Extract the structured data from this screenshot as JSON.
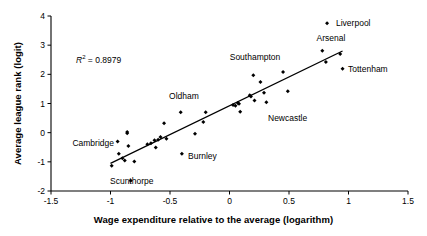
{
  "chart_data": {
    "type": "scatter",
    "title": "",
    "xlabel": "Wage expenditure relative to the average (logarithm)",
    "ylabel": "Average league rank (logit)",
    "xlim": [
      -1.5,
      1.5
    ],
    "ylim": [
      -2,
      4
    ],
    "xticks": [
      -1.5,
      -1,
      -0.5,
      0,
      0.5,
      1,
      1.5
    ],
    "xticklabels": [
      "-1.5",
      "-1",
      "-0.5",
      "0",
      "0.5",
      "1",
      "1.5"
    ],
    "yticks": [
      -2,
      -1,
      0,
      1,
      2,
      3,
      4
    ],
    "yticklabels": [
      "-2",
      "-1",
      "0",
      "1",
      "2",
      "3",
      "4"
    ],
    "grid": false,
    "legend": null,
    "marker": "diamond",
    "marker_color": "#000000",
    "annotations": [
      {
        "name": "r-squared",
        "text": "R2 = 0.8979",
        "r_symbol": "R",
        "superscript": "2",
        "equals_value": "= 0.8979",
        "x": -0.93,
        "y": 2.45
      }
    ],
    "trendline": {
      "type": "linear",
      "x_start": -1.0,
      "y_start": -1.05,
      "x_end": 0.95,
      "y_end": 2.8,
      "color": "#000000",
      "r_squared": 0.8979
    },
    "points": [
      {
        "x": -0.99,
        "y": -1.13,
        "label": ""
      },
      {
        "x": -0.94,
        "y": -0.3,
        "label": ""
      },
      {
        "x": -0.93,
        "y": -0.72,
        "label": ""
      },
      {
        "x": -0.9,
        "y": -0.88,
        "label": ""
      },
      {
        "x": -0.88,
        "y": -0.95,
        "label": ""
      },
      {
        "x": -0.86,
        "y": 0.02,
        "label": ""
      },
      {
        "x": -0.86,
        "y": -0.02,
        "label": ""
      },
      {
        "x": -0.85,
        "y": -0.46,
        "label": ""
      },
      {
        "x": -0.83,
        "y": -1.65,
        "label": "Scunthorpe",
        "label_pos": "right"
      },
      {
        "x": -0.8,
        "y": -0.99,
        "label": ""
      },
      {
        "x": -0.69,
        "y": -0.4,
        "label": ""
      },
      {
        "x": -0.66,
        "y": -0.36,
        "label": ""
      },
      {
        "x": -0.63,
        "y": -0.26,
        "label": ""
      },
      {
        "x": -0.62,
        "y": -0.51,
        "label": ""
      },
      {
        "x": -0.6,
        "y": -0.24,
        "label": ""
      },
      {
        "x": -0.58,
        "y": -0.15,
        "label": ""
      },
      {
        "x": -0.55,
        "y": 0.32,
        "label": ""
      },
      {
        "x": -0.53,
        "y": -0.21,
        "label": ""
      },
      {
        "x": -0.41,
        "y": 0.7,
        "label": "Oldham",
        "label_pos": "above"
      },
      {
        "x": -0.4,
        "y": -0.72,
        "label": "Burnley",
        "label_pos": "right"
      },
      {
        "x": -0.29,
        "y": -0.04,
        "label": ""
      },
      {
        "x": -0.22,
        "y": 0.37,
        "label": ""
      },
      {
        "x": -0.2,
        "y": 0.7,
        "label": ""
      },
      {
        "x": 0.03,
        "y": 0.95,
        "label": ""
      },
      {
        "x": 0.05,
        "y": 0.92,
        "label": ""
      },
      {
        "x": 0.07,
        "y": 1.02,
        "label": ""
      },
      {
        "x": 0.08,
        "y": 0.99,
        "label": ""
      },
      {
        "x": 0.09,
        "y": 0.72,
        "label": ""
      },
      {
        "x": 0.17,
        "y": 1.28,
        "label": ""
      },
      {
        "x": 0.18,
        "y": 1.24,
        "label": ""
      },
      {
        "x": 0.2,
        "y": 1.97,
        "label": "Southampton",
        "label_pos": "above"
      },
      {
        "x": 0.21,
        "y": 1.1,
        "label": ""
      },
      {
        "x": 0.26,
        "y": 1.74,
        "label": ""
      },
      {
        "x": 0.29,
        "y": 1.37,
        "label": ""
      },
      {
        "x": 0.31,
        "y": 1.04,
        "label": "Newcastle",
        "label_pos": "below-right"
      },
      {
        "x": 0.45,
        "y": 2.08,
        "label": ""
      },
      {
        "x": 0.49,
        "y": 1.42,
        "label": ""
      },
      {
        "x": 0.78,
        "y": 2.81,
        "label": "Arsenal",
        "label_pos": "above"
      },
      {
        "x": 0.81,
        "y": 2.42,
        "label": ""
      },
      {
        "x": 0.82,
        "y": 3.75,
        "label": "Liverpool",
        "label_pos": "right"
      },
      {
        "x": 0.93,
        "y": 2.7,
        "label": ""
      },
      {
        "x": 0.95,
        "y": 2.19,
        "label": "Tottenham",
        "label_pos": "right"
      }
    ]
  },
  "labels": {
    "liverpool": "Liverpool",
    "arsenal": "Arsenal",
    "tottenham": "Tottenham",
    "southampton": "Southampton",
    "newcastle": "Newcastle",
    "oldham": "Oldham",
    "cambridge": "Cambridge",
    "burnley": "Burnley",
    "scunthorpe": "Scunthorpe"
  },
  "callouts": [
    {
      "name": "liverpool",
      "text": "Liverpool",
      "x": 336,
      "y": 23,
      "align": "right"
    },
    {
      "name": "arsenal",
      "text": "Arsenal",
      "x": 331,
      "y": 43,
      "align": "above"
    },
    {
      "name": "tottenham",
      "text": "Tottenham",
      "x": 348,
      "y": 69,
      "align": "right"
    },
    {
      "name": "southampton",
      "text": "Southampton",
      "x": 255,
      "y": 62,
      "align": "above"
    },
    {
      "name": "newcastle",
      "text": "Newcastle",
      "x": 268,
      "y": 118,
      "align": "left-text"
    },
    {
      "name": "oldham",
      "text": "Oldham",
      "x": 184,
      "y": 101,
      "align": "above"
    },
    {
      "name": "cambridge",
      "text": "Cambridge",
      "x": 114,
      "y": 143,
      "align": "left"
    },
    {
      "name": "burnley",
      "text": "Burnley",
      "x": 188,
      "y": 156,
      "align": "right"
    },
    {
      "name": "scunthorpe",
      "text": "Scunthorpe",
      "x": 110,
      "y": 181,
      "align": "right"
    }
  ]
}
